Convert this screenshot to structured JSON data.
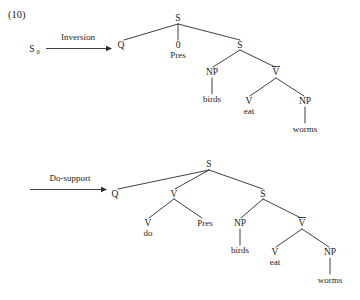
{
  "figure": {
    "example_number": "(10)",
    "background_color": "#ffffff",
    "ink_color": "#1c1c1c"
  },
  "derivations": [
    {
      "id": "inversion",
      "rule_label": "Inversion",
      "source_label": "S",
      "source_subscript": "0",
      "tree": {
        "root": "S",
        "nodes": [
          {
            "name": "root-s",
            "label": "S",
            "x": 178,
            "y": 21
          },
          {
            "name": "q-node",
            "label": "Q",
            "x": 123,
            "y": 47
          },
          {
            "name": "zero-node",
            "label": "0",
            "x": 178,
            "y": 47
          },
          {
            "name": "pres-node",
            "label": "Pres",
            "x": 178,
            "y": 58
          },
          {
            "name": "embedded-s",
            "label": "S",
            "x": 240,
            "y": 47
          },
          {
            "name": "np-subject",
            "label": "NP",
            "x": 212,
            "y": 74
          },
          {
            "name": "vbar-node",
            "label": "V",
            "x": 276,
            "y": 74,
            "bar": true
          },
          {
            "name": "birds-terminal",
            "label": "birds",
            "x": 212,
            "y": 102
          },
          {
            "name": "v-head",
            "label": "V",
            "x": 249,
            "y": 103
          },
          {
            "name": "eat-terminal",
            "label": "eat",
            "x": 249,
            "y": 113
          },
          {
            "name": "np-object",
            "label": "NP",
            "x": 305,
            "y": 103
          },
          {
            "name": "worms-terminal",
            "label": "worms",
            "x": 305,
            "y": 131
          }
        ]
      }
    },
    {
      "id": "do-support",
      "rule_label": "Do-support",
      "source_label": "",
      "source_subscript": "",
      "tree": {
        "root": "S",
        "nodes": [
          {
            "name": "root-s",
            "label": "S",
            "x": 209,
            "y": 167
          },
          {
            "name": "q-node",
            "label": "Q",
            "x": 117,
            "y": 196
          },
          {
            "name": "v-aux",
            "label": "V",
            "x": 174,
            "y": 196
          },
          {
            "name": "embedded-s",
            "label": "S",
            "x": 263,
            "y": 196
          },
          {
            "name": "v-do",
            "label": "V",
            "x": 148,
            "y": 225
          },
          {
            "name": "do-terminal",
            "label": "do",
            "x": 148,
            "y": 236
          },
          {
            "name": "pres-node",
            "label": "Pres",
            "x": 204,
            "y": 225
          },
          {
            "name": "np-subject",
            "label": "NP",
            "x": 240,
            "y": 225
          },
          {
            "name": "vbar-node",
            "label": "V",
            "x": 302,
            "y": 225,
            "bar": true
          },
          {
            "name": "birds-terminal",
            "label": "birds",
            "x": 240,
            "y": 253
          },
          {
            "name": "v-head",
            "label": "V",
            "x": 275,
            "y": 254
          },
          {
            "name": "eat-terminal",
            "label": "eat",
            "x": 275,
            "y": 264
          },
          {
            "name": "np-object",
            "label": "NP",
            "x": 330,
            "y": 254
          },
          {
            "name": "worms-terminal",
            "label": "worms",
            "x": 330,
            "y": 282
          }
        ]
      }
    }
  ],
  "labels": {
    "s_root": "S",
    "q": "Q",
    "zero": "0",
    "pres": "Pres",
    "np": "NP",
    "v": "V",
    "vbar": "V",
    "birds": "birds",
    "eat": "eat",
    "worms": "worms",
    "do": "do",
    "s_zero_base": "S",
    "s_zero_sub": "0",
    "inversion": "Inversion",
    "do_support": "Do-support",
    "example_number": "(10)"
  }
}
